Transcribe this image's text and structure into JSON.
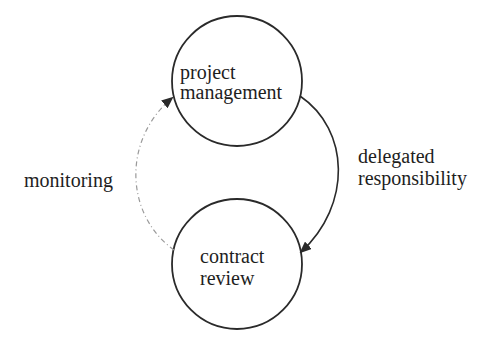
{
  "diagram": {
    "nodes": [
      {
        "id": "project-management",
        "lines": [
          "project",
          "management"
        ]
      },
      {
        "id": "contract-review",
        "lines": [
          "contract",
          "review"
        ]
      }
    ],
    "edges": [
      {
        "from": "project-management",
        "to": "contract-review",
        "label_lines": [
          "delegated",
          "responsibility"
        ],
        "style": "solid"
      },
      {
        "from": "contract-review",
        "to": "project-management",
        "label_lines": [
          "monitoring"
        ],
        "style": "dashed"
      }
    ]
  },
  "colors": {
    "stroke": "#2a2a2a",
    "dashed_stroke": "#9a9a9a",
    "text": "#1e1e1e",
    "background": "#ffffff"
  }
}
